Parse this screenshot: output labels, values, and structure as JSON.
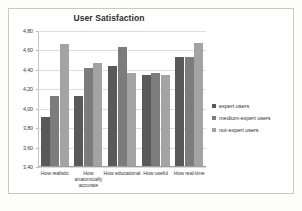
{
  "chart_data": {
    "type": "bar",
    "title": "User Satisfaction",
    "xlabel": "",
    "ylabel": "",
    "ylim": [
      3.4,
      4.8
    ],
    "grid": true,
    "legend_position": "right",
    "decimal_separator": ",",
    "categories": [
      "How realistic",
      "How anatomically accurate",
      "How educational",
      "How useful",
      "How real-time"
    ],
    "ytick_labels": [
      "4,80",
      "4,60",
      "4,40",
      "4,20",
      "4,00",
      "3,80",
      "3,60",
      "3,40"
    ],
    "ytick_values": [
      4.8,
      4.6,
      4.4,
      4.2,
      4.0,
      3.8,
      3.6,
      3.4
    ],
    "series": [
      {
        "name": "expert users",
        "color": "#595959",
        "values": [
          3.9,
          4.12,
          4.43,
          4.34,
          4.52
        ]
      },
      {
        "name": "medium-expert users",
        "color": "#7c7c7c",
        "values": [
          4.12,
          4.41,
          4.63,
          4.36,
          4.52
        ]
      },
      {
        "name": "not-expert users",
        "color": "#a3a3a3",
        "values": [
          4.66,
          4.46,
          4.36,
          4.34,
          4.67
        ]
      }
    ]
  }
}
